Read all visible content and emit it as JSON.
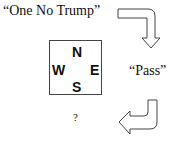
{
  "bids": {
    "north_bid": "“One No Trump”",
    "east_bid": "“Pass”",
    "south_bid": "?"
  },
  "compass": {
    "north": "N",
    "west": "W",
    "east": "E",
    "south": "S"
  },
  "arrows": [
    {
      "name": "arrow-north-to-east",
      "direction": "right-then-down"
    },
    {
      "name": "arrow-east-to-south",
      "direction": "down-then-left"
    }
  ]
}
